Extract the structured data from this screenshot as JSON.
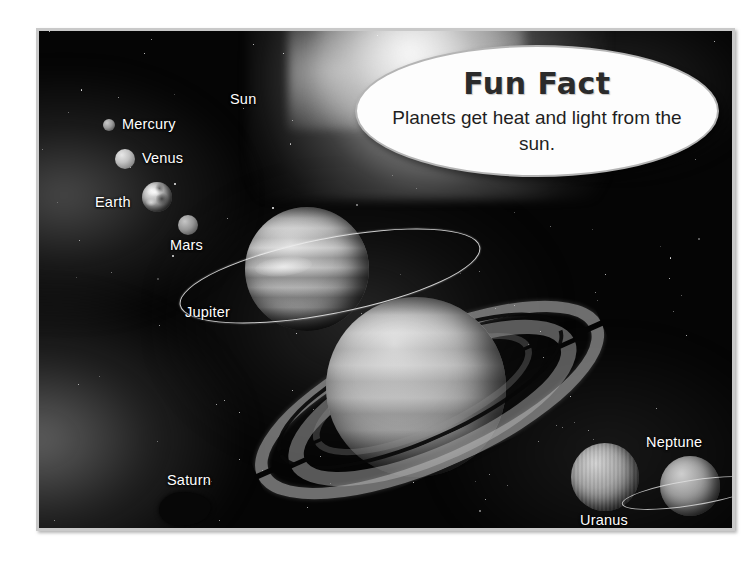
{
  "poster": {
    "title": "Solar System Diagram",
    "frame_color": "#c9c9c9",
    "background_color": "#050505"
  },
  "callout": {
    "name": "fun-fact-callout",
    "title": "Fun Fact",
    "body": "Planets get heat and light from the sun.",
    "shape": "ellipse",
    "fill_color": "#fdfdfd",
    "border_color": "#b4b4b4",
    "text_color": "#2b2b2b"
  },
  "labels": [
    {
      "id": "sun",
      "text": "Sun",
      "x": 191,
      "y": 60,
      "align": "left"
    },
    {
      "id": "mercury",
      "text": "Mercury",
      "x": 83,
      "y": 85,
      "align": "left"
    },
    {
      "id": "venus",
      "text": "Venus",
      "x": 103,
      "y": 119,
      "align": "left"
    },
    {
      "id": "earth",
      "text": "Earth",
      "x": 56,
      "y": 163,
      "align": "left"
    },
    {
      "id": "mars",
      "text": "Mars",
      "x": 131,
      "y": 206,
      "align": "left"
    },
    {
      "id": "jupiter",
      "text": "Jupiter",
      "x": 146,
      "y": 273,
      "align": "left"
    },
    {
      "id": "saturn",
      "text": "Saturn",
      "x": 128,
      "y": 441,
      "align": "left"
    },
    {
      "id": "uranus",
      "text": "Uranus",
      "x": 541,
      "y": 481,
      "align": "left"
    },
    {
      "id": "neptune",
      "text": "Neptune",
      "x": 607,
      "y": 403,
      "align": "left"
    },
    {
      "id": "pluto",
      "text": "Pluto",
      "x": 689,
      "y": 501,
      "align": "left"
    }
  ],
  "bodies": [
    {
      "id": "mercury",
      "name": "Mercury",
      "cx": 70,
      "cy": 94,
      "r": 6,
      "has_ring": false
    },
    {
      "id": "venus",
      "name": "Venus",
      "cx": 86,
      "cy": 128,
      "r": 10,
      "has_ring": false
    },
    {
      "id": "earth",
      "name": "Earth",
      "cx": 118,
      "cy": 166,
      "r": 15,
      "has_ring": false
    },
    {
      "id": "mars",
      "name": "Mars",
      "cx": 149,
      "cy": 194,
      "r": 10,
      "has_ring": false
    },
    {
      "id": "jupiter",
      "name": "Jupiter",
      "cx": 268,
      "cy": 238,
      "r": 62,
      "has_ring": true
    },
    {
      "id": "saturn",
      "name": "Saturn",
      "cx": 377,
      "cy": 356,
      "r": 90,
      "has_ring": true
    },
    {
      "id": "uranus",
      "name": "Uranus",
      "cx": 566,
      "cy": 446,
      "r": 34,
      "has_ring": false
    },
    {
      "id": "neptune",
      "name": "Neptune",
      "cx": 651,
      "cy": 455,
      "r": 30,
      "has_ring": true
    },
    {
      "id": "pluto",
      "name": "Pluto",
      "cx": 700,
      "cy": 476,
      "r": 7,
      "has_ring": false
    }
  ],
  "scene": {
    "sun_glow": "top-center bright nebula",
    "asteroid": {
      "cx": 146,
      "cy": 478,
      "w": 52,
      "h": 34
    },
    "star_count": 110
  }
}
